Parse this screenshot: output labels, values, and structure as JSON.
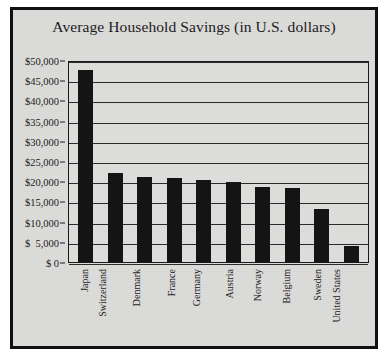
{
  "chart_data": {
    "type": "bar",
    "title": "Average Household Savings (in U.S. dollars)",
    "xlabel": "",
    "ylabel": "",
    "ylim": [
      0,
      50000
    ],
    "grid": true,
    "legend": "none",
    "orientation": "vertical",
    "bar_color": "#131313",
    "categories": [
      "Japan",
      "Switzerland",
      "Denmark",
      "France",
      "Germany",
      "Austria",
      "Norway",
      "Belgium",
      "Sweden",
      "United States"
    ],
    "values": [
      47500,
      22000,
      21000,
      20800,
      20300,
      19800,
      18500,
      18400,
      13000,
      4000
    ],
    "ytick_values": [
      0,
      5000,
      10000,
      15000,
      20000,
      25000,
      30000,
      35000,
      40000,
      45000,
      50000
    ],
    "ytick_labels": [
      "$ 0",
      "$  5,000",
      "$10,000",
      "$15,000",
      "$20,000",
      "$25,000",
      "$30,000",
      "$35,000",
      "$40,000",
      "$45,000",
      "$50,000"
    ]
  },
  "figure": {
    "background_color": "#dcdcda",
    "frame_color": "#101010",
    "plot_background_color": "#dededc",
    "gridline_color": "#2a2a2a",
    "text_color": "#1b1b1b"
  }
}
